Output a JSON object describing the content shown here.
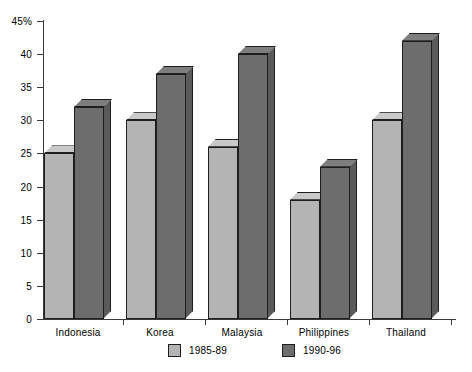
{
  "chart_data": {
    "type": "bar",
    "title": "",
    "xlabel": "",
    "ylabel": "",
    "ylim": [
      0,
      45
    ],
    "yunit": "%",
    "grid": false,
    "legend_position": "bottom",
    "categories": [
      "Indonesia",
      "Korea",
      "Malaysia",
      "Philippines",
      "Thailand"
    ],
    "series": [
      {
        "name": "1985-89",
        "color": "#b4b4b4",
        "values": [
          25,
          30,
          26,
          18,
          30
        ]
      },
      {
        "name": "1990-96",
        "color": "#6d6d6d",
        "values": [
          32,
          37,
          40,
          23,
          42
        ]
      }
    ],
    "y_ticks": [
      {
        "value": 45,
        "label": "45%"
      },
      {
        "value": 40,
        "label": "40"
      },
      {
        "value": 35,
        "label": "35"
      },
      {
        "value": 30,
        "label": "30"
      },
      {
        "value": 25,
        "label": "25"
      },
      {
        "value": 20,
        "label": "20"
      },
      {
        "value": 15,
        "label": "15"
      },
      {
        "value": 10,
        "label": "10"
      },
      {
        "value": 5,
        "label": "5"
      },
      {
        "value": 0,
        "label": "0"
      }
    ]
  },
  "legend": {
    "items": [
      {
        "label": "1985-89",
        "swatch": "light"
      },
      {
        "label": "1990-96",
        "swatch": "dark"
      }
    ]
  }
}
